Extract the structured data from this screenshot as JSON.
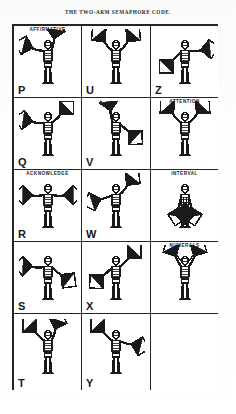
{
  "plate": {
    "title": "THE TWO-ARM SEMAPHORE CODE.",
    "ink_color": "#1d1d1d",
    "paper_color": "#fdfdfc",
    "border_color": "#242424"
  },
  "grid": {
    "columns": 3,
    "rows": 5,
    "cells": [
      {
        "id": "cell-p",
        "header": "AFFIRMATIVE",
        "letter": "P",
        "pose": "p",
        "empty": false
      },
      {
        "id": "cell-u",
        "header": "",
        "letter": "U",
        "pose": "u",
        "empty": false
      },
      {
        "id": "cell-z",
        "header": "",
        "letter": "Z",
        "pose": "z",
        "empty": false
      },
      {
        "id": "cell-q",
        "header": "",
        "letter": "Q",
        "pose": "q",
        "empty": false
      },
      {
        "id": "cell-v",
        "header": "",
        "letter": "V",
        "pose": "v",
        "empty": false
      },
      {
        "id": "cell-attention",
        "header": "ATTENTION",
        "letter": "",
        "pose": "attention",
        "empty": false
      },
      {
        "id": "cell-r",
        "header": "ACKNOWLEDGE",
        "letter": "R",
        "pose": "r",
        "empty": false
      },
      {
        "id": "cell-w",
        "header": "",
        "letter": "W",
        "pose": "w",
        "empty": false
      },
      {
        "id": "cell-interval",
        "header": "INTERVAL",
        "letter": "",
        "pose": "interval",
        "empty": false
      },
      {
        "id": "cell-s",
        "header": "",
        "letter": "S",
        "pose": "s",
        "empty": false
      },
      {
        "id": "cell-x",
        "header": "",
        "letter": "X",
        "pose": "x",
        "empty": false
      },
      {
        "id": "cell-numerals",
        "header": "NUMERALS",
        "letter": "",
        "pose": "numerals",
        "empty": false
      },
      {
        "id": "cell-t",
        "header": "",
        "letter": "T",
        "pose": "t",
        "empty": false
      },
      {
        "id": "cell-y",
        "header": "",
        "letter": "Y",
        "pose": "y",
        "empty": false
      },
      {
        "id": "cell-blank",
        "header": "",
        "letter": "",
        "pose": "none",
        "empty": true
      }
    ]
  }
}
